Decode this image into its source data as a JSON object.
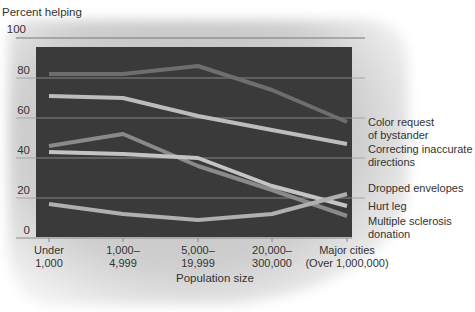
{
  "chart_data": {
    "type": "line",
    "title": "",
    "ylabel": "Percent helping",
    "xlabel": "Population size",
    "ylim": [
      0,
      100
    ],
    "yticks": [
      "0",
      "20",
      "40",
      "60",
      "80",
      "100"
    ],
    "categories": [
      "Under 1,000",
      "1,000–4,999",
      "5,000–19,999",
      "20,000–300,000",
      "Major cities (Over 1,000,000)"
    ],
    "category_lines": [
      [
        "Under",
        "1,000"
      ],
      [
        "1,000–",
        "4,999"
      ],
      [
        "5,000–",
        "19,999"
      ],
      [
        "20,000–",
        "300,000"
      ],
      [
        "Major cities",
        "(Over 1,000,000)"
      ]
    ],
    "grid": true,
    "legend_position": "right (line-end labels)",
    "series": [
      {
        "name": "Color request of bystander",
        "label_lines": [
          "Color request",
          "of bystander"
        ],
        "values": [
          82,
          82,
          86,
          74,
          58
        ],
        "color": "#6e6e6e"
      },
      {
        "name": "Correcting inaccurate directions",
        "label_lines": [
          "Correcting inaccurate",
          "directions"
        ],
        "values": [
          71,
          70,
          61,
          54,
          47
        ],
        "color": "#bdbdbd"
      },
      {
        "name": "Dropped envelopes",
        "label_lines": [
          "Dropped envelopes"
        ],
        "values": [
          46,
          52,
          36,
          24,
          11
        ],
        "color": "#8a8a8a"
      },
      {
        "name": "Hurt leg",
        "label_lines": [
          "Hurt leg"
        ],
        "values": [
          43,
          42,
          40,
          26,
          16
        ],
        "color": "#c4c4c4"
      },
      {
        "name": "Multiple sclerosis donation",
        "label_lines": [
          "Multiple sclerosis",
          "donation"
        ],
        "values": [
          17,
          12,
          9,
          12,
          22
        ],
        "color": "#b0b0b0"
      }
    ]
  },
  "plot_background": "#3a3a3a"
}
